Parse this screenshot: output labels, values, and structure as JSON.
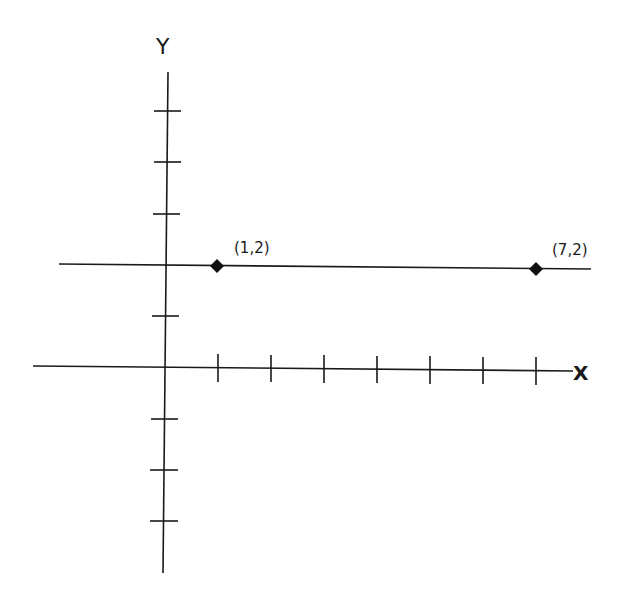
{
  "diagram": {
    "type": "coordinate-plane",
    "axes": {
      "x_label": "X",
      "y_label": "Y",
      "x_ticks": [
        1,
        2,
        3,
        4,
        5,
        6,
        7
      ],
      "y_ticks": [
        -4,
        -3,
        -2,
        -1,
        1,
        2,
        3,
        4,
        5
      ]
    },
    "line": {
      "description": "horizontal line y = 2",
      "equation": "y = 2"
    },
    "points": [
      {
        "x": 1,
        "y": 2,
        "label": "(1,2)"
      },
      {
        "x": 7,
        "y": 2,
        "label": "(7,2)"
      }
    ],
    "colors": {
      "ink": "#1a1a1a",
      "background": "#ffffff"
    }
  }
}
